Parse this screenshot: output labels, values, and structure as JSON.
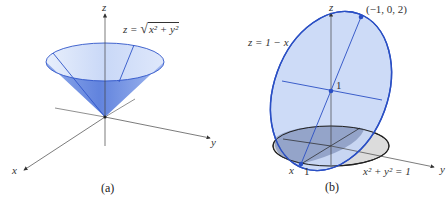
{
  "figure": {
    "panels": [
      {
        "id": "a",
        "caption": "(a)",
        "axes": {
          "x": "x",
          "y": "y",
          "z": "z"
        },
        "equation": "z = √(x² + y²)",
        "equation_parts": {
          "lhs": "z =",
          "radicand": "x² + y²"
        },
        "surface": "cone",
        "colors": {
          "fill_light": "#dbe6fa",
          "fill_dark": "#6f90e0",
          "edge": "#2f55c8"
        }
      },
      {
        "id": "b",
        "caption": "(b)",
        "axes": {
          "x": "x",
          "y": "y",
          "z": "z"
        },
        "plane_equation": "z = 1 − x",
        "cylinder_equation": "x² + y² = 1",
        "points": [
          {
            "label": "(−1, 0, 2)",
            "role": "top-of-ellipse"
          },
          {
            "label": "1",
            "role": "z-intercept"
          },
          {
            "label": "1",
            "role": "x-intercept"
          }
        ],
        "colors": {
          "ellipse_fill": "#c4d5f6",
          "ellipse_edge": "#2a4fc4",
          "disk_fill": "#d9d9d9",
          "overlap_fill": "#7d8fb8"
        }
      }
    ]
  }
}
